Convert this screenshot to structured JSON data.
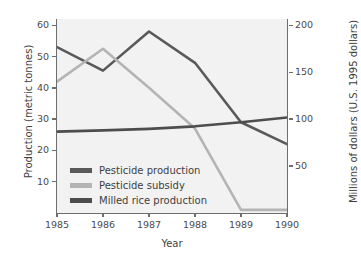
{
  "chart_data": {
    "type": "line",
    "title": "",
    "xlabel": "Year",
    "ylabel": "Production (metric tonnes)",
    "ylabel_right": "Millions of dollars (U.S. 1995 dollars)",
    "x": [
      1985,
      1986,
      1987,
      1988,
      1989,
      1990
    ],
    "xticklabels": [
      "1985",
      "1986",
      "1987",
      "1988",
      "1989",
      "1990"
    ],
    "xlim": [
      1985,
      1990
    ],
    "ylim": [
      0,
      62
    ],
    "yticks": [
      10,
      20,
      30,
      40,
      50,
      60
    ],
    "yticklabels": [
      "10",
      "20",
      "30",
      "40",
      "50",
      "60"
    ],
    "ylim_right": [
      0,
      206.7
    ],
    "yticks_right": [
      50,
      100,
      150,
      200
    ],
    "yticklabels_right": [
      "50",
      "100",
      "150",
      "200"
    ],
    "grid": false,
    "legend_position": "lower-left-inside",
    "plot_background": "#f2f2f2",
    "series": [
      {
        "name": "Pesticide production",
        "axis": "left",
        "color": "#595959",
        "values": [
          53.0,
          45.5,
          58.0,
          48.0,
          29.0,
          22.0
        ]
      },
      {
        "name": "Pesticide subsidy",
        "axis": "left",
        "color": "#b4b4b4",
        "values": [
          42.0,
          52.5,
          40.0,
          27.0,
          1.0,
          1.0
        ]
      },
      {
        "name": "Milled rice production",
        "axis": "left",
        "color": "#4d4d4d",
        "values": [
          26.0,
          26.4,
          26.9,
          27.7,
          29.0,
          30.5
        ]
      }
    ]
  },
  "legend": {
    "items": [
      {
        "label": "Pesticide production",
        "color": "#595959"
      },
      {
        "label": "Pesticide subsidy",
        "color": "#b4b4b4"
      },
      {
        "label": "Milled rice production",
        "color": "#4d4d4d"
      }
    ]
  }
}
